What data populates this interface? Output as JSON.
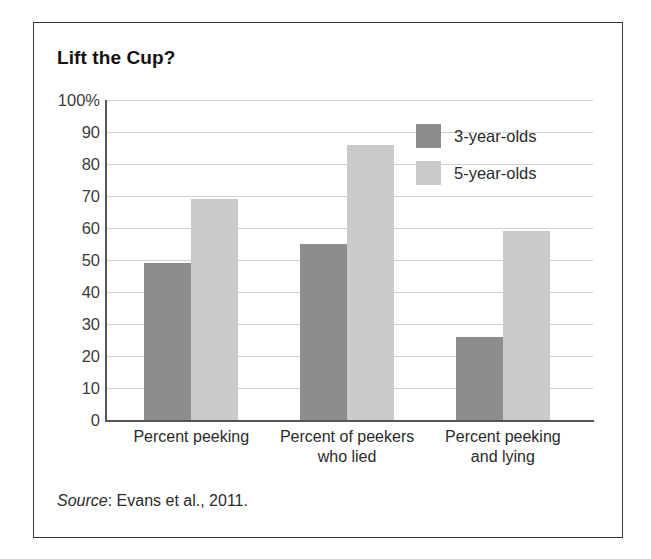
{
  "figure": {
    "title": "Lift the Cup?",
    "source_label": "Source",
    "source_separator": ":",
    "source_text": " Evans et al., 2011."
  },
  "colors": {
    "bar_3yo": "#8d8d8d",
    "bar_5yo": "#cacaca",
    "gridline": "#d2d2d2",
    "axis": "#555555",
    "frame": "#3a3a3a"
  },
  "chart_data": {
    "type": "bar",
    "title": "Lift the Cup?",
    "xlabel": "",
    "ylabel": "",
    "ylim": [
      0,
      100
    ],
    "yticks": [
      0,
      10,
      20,
      30,
      40,
      50,
      60,
      70,
      80,
      90,
      100
    ],
    "ytick_labels": [
      "0",
      "10",
      "20",
      "30",
      "40",
      "50",
      "60",
      "70",
      "80",
      "90",
      "100%"
    ],
    "grid": true,
    "legend_position": "upper right",
    "categories": [
      "Percent peeking",
      "Percent of peekers who lied",
      "Percent peeking and lying"
    ],
    "category_lines": [
      [
        "Percent peeking"
      ],
      [
        "Percent of peekers",
        "who lied"
      ],
      [
        "Percent peeking",
        "and lying"
      ]
    ],
    "series": [
      {
        "name": "3-year-olds",
        "color": "#8d8d8d",
        "values": [
          49,
          55,
          26
        ]
      },
      {
        "name": "5-year-olds",
        "color": "#cacaca",
        "values": [
          69,
          86,
          59
        ]
      }
    ]
  }
}
